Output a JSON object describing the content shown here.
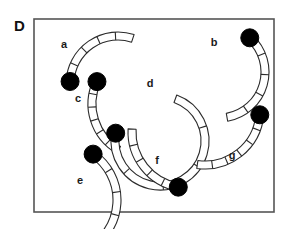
{
  "figure": {
    "panel_letter": "D",
    "frame": {
      "x": 34,
      "y": 19,
      "width": 240,
      "height": 193,
      "stroke_color": "#555555",
      "fill_color": "#ffffff",
      "stroke_width": 1.6
    },
    "style": {
      "band_stroke": "#2b2b2b",
      "band_fill": "#ffffff",
      "band_stroke_width": 1.1,
      "circle_fill": "#000000",
      "circle_stroke": "#000000",
      "label_color": "#1a1a1a",
      "background": "#ffffff"
    },
    "arcs": [
      {
        "id": "arc-a",
        "label": "a",
        "label_x": 64,
        "label_y": 48,
        "cx": 118,
        "cy": 84,
        "r": 48,
        "band_width": 8,
        "start_angle": 183,
        "end_angle": 288,
        "segments": 5,
        "bead_end": "start",
        "bead_r": 9
      },
      {
        "id": "arc-b",
        "label": "b",
        "label_x": 214,
        "label_y": 46,
        "cx": 219,
        "cy": 72,
        "r": 46,
        "band_width": 8,
        "start_angle": 312,
        "end_angle": 80,
        "segments": 5,
        "bead_end": "start",
        "bead_r": 9
      },
      {
        "id": "arc-c",
        "label": "c",
        "label_x": 78,
        "label_y": 102,
        "cx": 145,
        "cy": 104,
        "r": 53,
        "band_width": 8,
        "start_angle": 205,
        "end_angle": 120,
        "segments": 6,
        "bead_end": "start",
        "bead_r": 9,
        "reverse": true
      },
      {
        "id": "arc-d",
        "label": "d",
        "label_x": 150,
        "label_y": 87,
        "cx": 160,
        "cy": 141,
        "r": 45,
        "band_width": 8,
        "start_angle": 190,
        "end_angle": 290,
        "segments": 5,
        "bead_end": "start",
        "bead_r": 9,
        "reverse": true
      },
      {
        "id": "arc-e",
        "label": "e",
        "label_x": 80,
        "label_y": 184,
        "cx": 61,
        "cy": 200,
        "r": 56,
        "band_width": 8,
        "start_angle": 305,
        "end_angle": 62,
        "segments": 5,
        "bead_end": "start",
        "bead_r": 9
      },
      {
        "id": "arc-f",
        "label": "f",
        "label_x": 157,
        "label_y": 164,
        "cx": 188,
        "cy": 132,
        "r": 56,
        "band_width": 8,
        "start_angle": 183,
        "end_angle": 100,
        "segments": 5,
        "bead_end": "end",
        "bead_r": 9,
        "reverse": true
      },
      {
        "id": "arc-g",
        "label": "g",
        "label_x": 232,
        "label_y": 159,
        "cx": 205,
        "cy": 110,
        "r": 55,
        "band_width": 8,
        "start_angle": 5,
        "end_angle": 98,
        "segments": 6,
        "bead_end": "start",
        "bead_r": 9
      }
    ]
  }
}
